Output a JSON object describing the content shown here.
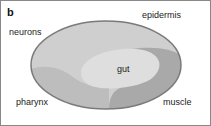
{
  "panel_label": "b",
  "labels": {
    "epidermis": "epidermis",
    "neurons": "neurons",
    "gut": "gut",
    "pharynx": "pharynx",
    "muscle": "muscle"
  },
  "colors": {
    "outline": "#7a7a7a",
    "epidermis_fill": "#cfcfcf",
    "gut_fill": "#dedede",
    "pharynx_fill": "#bdbdbd",
    "muscle_fill": "#a9a9a9"
  }
}
